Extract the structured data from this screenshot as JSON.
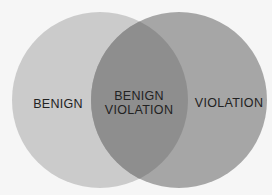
{
  "diagram": {
    "type": "venn",
    "circles": [
      {
        "label": "BENIGN",
        "color": "#cbcbcb"
      },
      {
        "label": "VIOLATION",
        "color": "#a6a6a6"
      }
    ],
    "intersection": {
      "line1": "BENIGN",
      "line2": "VIOLATION",
      "color": "#8e8e8e"
    }
  }
}
